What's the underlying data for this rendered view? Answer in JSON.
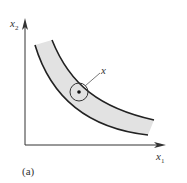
{
  "figure": {
    "panel_label": "(a)",
    "axes": {
      "x_label": "x",
      "x_subscript": "1",
      "y_label": "x",
      "y_subscript": "2"
    },
    "point_label": "x",
    "colors": {
      "stroke": "#222222",
      "band_fill": "#e2e2e2",
      "axis": "#333333"
    }
  }
}
